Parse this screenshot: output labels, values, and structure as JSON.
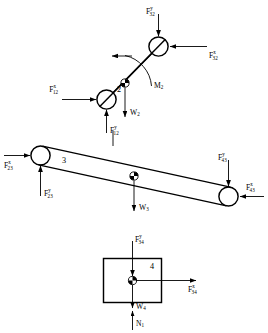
{
  "diagram": {
    "type": "free-body-diagram",
    "stroke_color": "#000000",
    "background_color": "#ffffff"
  },
  "link2": {
    "number": "2",
    "moment": {
      "base": "M",
      "sub": "2"
    },
    "weight": {
      "base": "W",
      "sub": "2"
    },
    "forces": [
      {
        "id": "f32y",
        "base": "F",
        "sup": "y",
        "sub": "32",
        "direction": "down",
        "position": "top"
      },
      {
        "id": "f32x",
        "base": "F",
        "sup": "x",
        "sub": "32",
        "direction": "left",
        "position": "right"
      },
      {
        "id": "f12x",
        "base": "F",
        "sup": "x",
        "sub": "12",
        "direction": "right",
        "position": "left"
      },
      {
        "id": "f12y",
        "base": "F",
        "sup": "y",
        "sub": "12",
        "direction": "up",
        "position": "bottom"
      }
    ]
  },
  "link3": {
    "number": "3",
    "weight": {
      "base": "W",
      "sub": "3"
    },
    "forces": [
      {
        "id": "f23x",
        "base": "F",
        "sup": "x",
        "sub": "23",
        "direction": "right",
        "position": "left"
      },
      {
        "id": "f23y",
        "base": "F",
        "sup": "y",
        "sub": "23",
        "direction": "up",
        "position": "bottom-left"
      },
      {
        "id": "f43y",
        "base": "F",
        "sup": "y",
        "sub": "43",
        "direction": "down",
        "position": "top-right"
      },
      {
        "id": "f43x",
        "base": "F",
        "sup": "x",
        "sub": "43",
        "direction": "left",
        "position": "right"
      }
    ]
  },
  "link4": {
    "number": "4",
    "weight": {
      "base": "W",
      "sub": "4"
    },
    "normal": {
      "base": "N",
      "sub": "1"
    },
    "forces": [
      {
        "id": "f34y",
        "base": "F",
        "sup": "y",
        "sub": "34",
        "direction": "down",
        "position": "top"
      },
      {
        "id": "f34x",
        "base": "F",
        "sup": "x",
        "sub": "34",
        "direction": "right",
        "position": "right"
      }
    ]
  }
}
